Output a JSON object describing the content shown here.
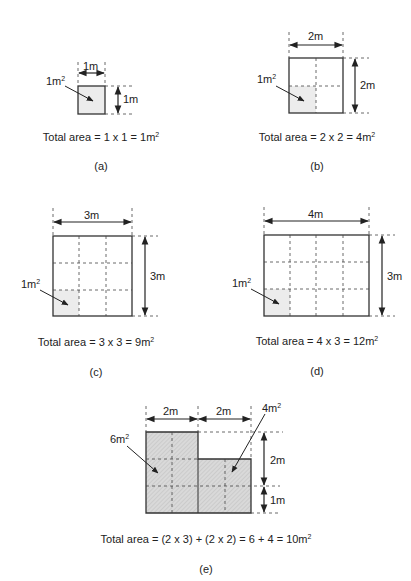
{
  "figures": [
    {
      "id": "a",
      "panel_label": "(a)",
      "width_label": "1m",
      "height_label": "1m",
      "unit_area_label": "1m",
      "unit_area_exp": "2",
      "total_text": "Total area = 1 x 1 = 1m",
      "total_exp": "2"
    },
    {
      "id": "b",
      "panel_label": "(b)",
      "width_label": "2m",
      "height_label": "2m",
      "unit_area_label": "1m",
      "unit_area_exp": "2",
      "total_text": "Total area = 2 x 2 = 4m",
      "total_exp": "2"
    },
    {
      "id": "c",
      "panel_label": "(c)",
      "width_label": "3m",
      "height_label": "3m",
      "unit_area_label": "1m",
      "unit_area_exp": "2",
      "total_text": "Total area = 3 x 3 = 9m",
      "total_exp": "2"
    },
    {
      "id": "d",
      "panel_label": "(d)",
      "width_label": "4m",
      "height_label": "3m",
      "unit_area_label": "1m",
      "unit_area_exp": "2",
      "total_text": "Total area = 4 x 3 = 12m",
      "total_exp": "2"
    },
    {
      "id": "e",
      "panel_label": "(e)",
      "width_label_left": "2m",
      "width_label_right": "2m",
      "height_label_upper": "2m",
      "height_label_lower": "1m",
      "left_area_label": "6m",
      "left_area_exp": "2",
      "right_area_label": "4m",
      "right_area_exp": "2",
      "total_text": "Total area = (2 x 3) + (2 x 2) = 6 + 4 = 10m",
      "total_exp": "2"
    }
  ],
  "colors": {
    "stroke": "#333333",
    "unit_fill": "#ececec",
    "hatch_fill": "#d4d4d4"
  }
}
